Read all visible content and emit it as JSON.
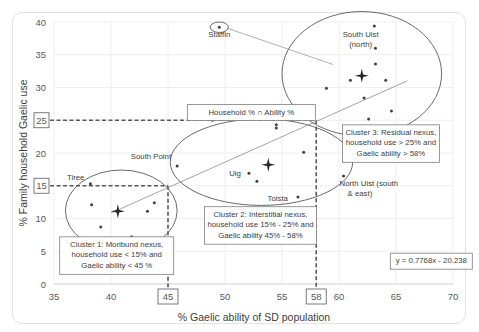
{
  "chart_data": {
    "type": "scatter",
    "title": "",
    "xlabel": "% Gaelic ability of SD population",
    "ylabel": "% Family household Gaelic use",
    "xlim": [
      35,
      70
    ],
    "ylim": [
      0,
      40
    ],
    "x_ticks": [
      35,
      40,
      45,
      50,
      55,
      60,
      65,
      70
    ],
    "y_ticks": [
      0,
      5,
      10,
      15,
      20,
      25,
      30,
      35,
      40
    ],
    "boxed_x_ticks": [
      45,
      58
    ],
    "boxed_y_ticks": [
      15,
      25
    ],
    "grid": true,
    "series": [
      {
        "name": "Settlement districts",
        "points": [
          {
            "x": 49.5,
            "y": 39.2,
            "label": "Staffin"
          },
          {
            "x": 38.2,
            "y": 15.3,
            "label": "Tiree"
          },
          {
            "x": 38.3,
            "y": 12.1
          },
          {
            "x": 39.1,
            "y": 8.7
          },
          {
            "x": 41.8,
            "y": 7.2
          },
          {
            "x": 43.2,
            "y": 11.1
          },
          {
            "x": 43.8,
            "y": 12.4
          },
          {
            "x": 45.8,
            "y": 18.0,
            "label": "South Point"
          },
          {
            "x": 48.9,
            "y": 25.0
          },
          {
            "x": 54.5,
            "y": 24.3
          },
          {
            "x": 54.5,
            "y": 23.8
          },
          {
            "x": 56.9,
            "y": 20.1
          },
          {
            "x": 52.1,
            "y": 16.9,
            "label": "Uig"
          },
          {
            "x": 52.8,
            "y": 15.7
          },
          {
            "x": 56.4,
            "y": 13.3,
            "label": "Tolsta"
          },
          {
            "x": 60.4,
            "y": 16.5,
            "label": "North Uist (south & east)"
          },
          {
            "x": 63.1,
            "y": 39.4
          },
          {
            "x": 63.2,
            "y": 36.0
          },
          {
            "x": 63.2,
            "y": 33.6
          },
          {
            "x": 58.9,
            "y": 29.9
          },
          {
            "x": 61.0,
            "y": 31.1
          },
          {
            "x": 64.1,
            "y": 31.1
          },
          {
            "x": 62.2,
            "y": 28.4
          },
          {
            "x": 64.6,
            "y": 26.4
          },
          {
            "x": 62.6,
            "y": 25.2
          }
        ]
      }
    ],
    "centroids": [
      {
        "cluster": "Cluster 1",
        "x": 40.6,
        "y": 11.1
      },
      {
        "cluster": "Cluster 2",
        "x": 53.8,
        "y": 18.2
      },
      {
        "cluster": "Cluster 3",
        "x": 62.0,
        "y": 31.8
      }
    ],
    "clusters": [
      {
        "name": "Cluster 1",
        "center": [
          40.9,
          11.2
        ],
        "rx_units": 4.9,
        "ry_units": 6.2
      },
      {
        "name": "Cluster 2",
        "center": [
          53.2,
          18.6
        ],
        "rx_units": 8.0,
        "ry_units": 6.6
      },
      {
        "name": "Cluster 3",
        "center": [
          62.0,
          32.1
        ],
        "rx_units": 7.0,
        "ry_units": 9.5
      },
      {
        "name": "Staffin",
        "center": [
          49.5,
          39.2
        ],
        "rx_units": 0.8,
        "ry_units": 0.8
      }
    ],
    "trendline": {
      "slope": 0.7768,
      "intercept": -20.238,
      "x_range": [
        40,
        66
      ],
      "equation": "y = 0.7768x - 20.238"
    },
    "reference_lines": [
      {
        "type": "horizontal",
        "y": 15,
        "x_to": 45
      },
      {
        "type": "horizontal",
        "y": 25,
        "x_to": 58
      },
      {
        "type": "vertical",
        "x": 45,
        "y_to": 15
      },
      {
        "type": "vertical",
        "x": 58,
        "y_to": 25
      }
    ],
    "annotations": [
      {
        "id": "intersect",
        "text": [
          "Household % ∩ Ability %"
        ]
      },
      {
        "id": "cluster1",
        "text": [
          "Cluster 1: Moribund nexus,",
          "household use < 15% and",
          "Gaelic ability < 45 %"
        ]
      },
      {
        "id": "cluster2",
        "text": [
          "Cluster 2: Interstitial nexus,",
          "household use 15% - 25% and",
          "Gaelic ability 45% - 58%"
        ]
      },
      {
        "id": "cluster3",
        "text": [
          "Cluster 3: Residual nexus,",
          "household use > 25% and",
          "Gaelic ability > 58%"
        ]
      },
      {
        "id": "equation",
        "text": [
          "y = 0.7768x - 20.238"
        ]
      },
      {
        "id": "south-uist",
        "text": [
          "South Uist",
          "(north)"
        ]
      }
    ],
    "colors": {
      "points": "#404040",
      "ellipse": "#595959",
      "trend": "#8c8c8c",
      "grid": "#eeeeee",
      "dash": "#595959"
    }
  }
}
